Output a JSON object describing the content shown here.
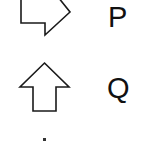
{
  "items": [
    {
      "icon": "arrow-right-outline-icon",
      "label": "P"
    },
    {
      "icon": "arrow-up-outline-icon",
      "label": "Q"
    },
    {
      "icon": "partial-shape-cut-off",
      "label": ""
    }
  ],
  "colors": {
    "stroke": "#1a1a1a",
    "text": "#111111",
    "background": "#ffffff"
  }
}
